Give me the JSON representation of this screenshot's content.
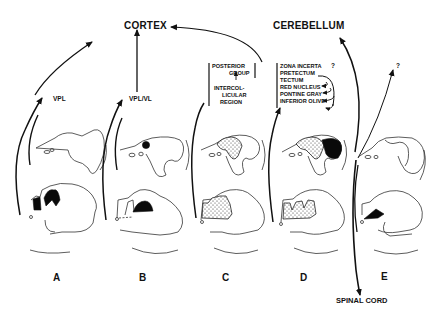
{
  "figure": {
    "targets": {
      "cortex": "CORTEX",
      "cerebellum": "CEREBELLUM",
      "spinal_cord": "SPINAL  CORD",
      "unknown": "?"
    },
    "relays": {
      "a": "VPL",
      "b": "VPL/VL"
    },
    "panel_c_list": [
      "POSTERIOR",
      "GROUP",
      "INTERCOL-",
      "LICULAR",
      "REGION"
    ],
    "panel_d_list": [
      "ZONA INCERTA",
      "PRETECTUM",
      "TECTUM",
      "RED NUCLEUS",
      "PONTINE GRAY",
      "INFERIOR OLIVE"
    ],
    "panel_d_uncertain": "?",
    "panels": [
      "A",
      "B",
      "C",
      "D",
      "E"
    ]
  }
}
